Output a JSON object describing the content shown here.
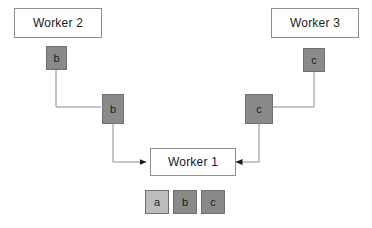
{
  "diagram": {
    "type": "flow-diagram",
    "background_color": "#ffffff",
    "line_color": "#8c8c8c",
    "arrow_color": "#1a1a1a",
    "tile_dark_color": "#8a8a8a",
    "tile_light_color": "#bdbdbd",
    "box_border_color": "#8c8c8c",
    "nodes": {
      "worker2": {
        "label": "Worker 2"
      },
      "worker3": {
        "label": "Worker 3"
      },
      "worker1": {
        "label": "Worker 1"
      }
    },
    "tiles": {
      "worker2_out": {
        "label": "b",
        "shade": "dark"
      },
      "worker2_mid": {
        "label": "b",
        "shade": "dark"
      },
      "worker3_out": {
        "label": "c",
        "shade": "dark"
      },
      "worker3_mid": {
        "label": "c",
        "shade": "dark"
      },
      "worker1_buffer": [
        {
          "label": "a",
          "shade": "light"
        },
        {
          "label": "b",
          "shade": "dark"
        },
        {
          "label": "c",
          "shade": "dark"
        }
      ]
    }
  }
}
